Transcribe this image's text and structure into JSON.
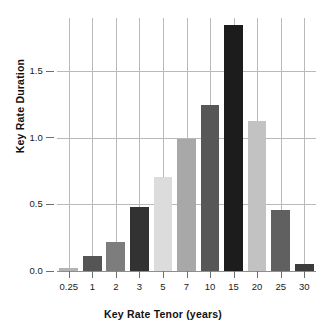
{
  "chart_data": {
    "type": "bar",
    "title": "",
    "xlabel": "Key Rate Tenor (years)",
    "ylabel": "Key Rate Duration",
    "categories": [
      "0.25",
      "1",
      "2",
      "3",
      "5",
      "7",
      "10",
      "15",
      "20",
      "25",
      "30"
    ],
    "values": [
      0.02,
      0.11,
      0.22,
      0.48,
      0.71,
      0.99,
      1.25,
      1.85,
      1.13,
      0.46,
      0.05
    ],
    "bar_colors": [
      "#b4b4b4",
      "#555555",
      "#7d7d7d",
      "#323232",
      "#dcdcdc",
      "#a8a8a8",
      "#575757",
      "#1c1c1c",
      "#c2c2c2",
      "#606060",
      "#3c3c3c"
    ],
    "ylim": [
      0.0,
      1.9
    ],
    "yticks": [
      0.0,
      0.5,
      1.0,
      1.5
    ],
    "ytick_labels": [
      "0.0",
      "0.5",
      "1.0",
      "1.5"
    ],
    "xtick_labels": [
      "0.25",
      "1",
      "2",
      "3",
      "5",
      "7",
      "10",
      "15",
      "20",
      "25",
      "30"
    ],
    "grid": {
      "horizontal": true,
      "vertical": true,
      "color": "#b9b9b9"
    },
    "legend": null,
    "background": "#ffffff",
    "axis_color": "#6d6d6d"
  }
}
